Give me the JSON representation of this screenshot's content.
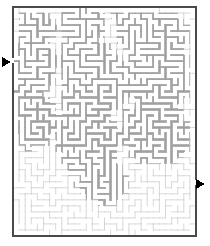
{
  "puzzle": {
    "kind": "maze",
    "title": "Maze Puzzle",
    "shape": "rectangular-grid",
    "cols": 30,
    "rows": 38
  },
  "canvas": {
    "width": 210,
    "height": 246,
    "background": "#ffffff"
  },
  "maze": {
    "x": 13,
    "y": 7,
    "width": 183,
    "height": 229,
    "cell": 6.1,
    "border_color": "#4a4a4a",
    "border_width": 1.1,
    "thin_wall_color": "#c9c9c9",
    "thin_wall_width": 0.7,
    "thick_wall_color": "#b3b3b3",
    "thick_wall_stroke": "#9a9a9a",
    "passage_color": "#ffffff"
  },
  "entrance": {
    "label": "entrance-arrow",
    "side": "left",
    "x": 2,
    "y": 57,
    "color": "#000000",
    "glyph": "▶"
  },
  "exit": {
    "label": "exit-arrow",
    "side": "right",
    "x": 196,
    "y": 179,
    "color": "#000000",
    "glyph": "▶"
  },
  "blob_regions": [
    {
      "name": "upper-left-mass",
      "points": "18,14 46,11 58,22 52,40 30,46 16,38"
    },
    {
      "name": "upper-mid-mass",
      "points": "60,10 96,9 108,20 100,40 74,44 58,30"
    },
    {
      "name": "upper-right-mass",
      "points": "112,12 176,14 190,30 184,54 150,60 118,44"
    },
    {
      "name": "mid-left-mass",
      "points": "14,44 44,42 60,56 56,84 30,96 14,80"
    },
    {
      "name": "center-mass",
      "points": "62,46 110,44 130,62 126,104 92,120 64,100"
    },
    {
      "name": "mid-right-mass",
      "points": "132,50 190,58 192,96 168,116 136,106 126,78"
    },
    {
      "name": "lower-left-mass",
      "points": "14,86 44,92 58,112 50,142 24,152 12,124"
    },
    {
      "name": "lower-center-mass",
      "points": "60,104 104,112 124,134 112,168 72,176 56,148"
    },
    {
      "name": "lower-right-mass",
      "points": "126,108 184,112 194,140 176,166 136,166 122,138"
    },
    {
      "name": "tail-mass",
      "points": "84,168 122,166 132,186 112,206 86,200 76,184"
    }
  ],
  "legend": {
    "entrance_text": "",
    "exit_text": ""
  }
}
